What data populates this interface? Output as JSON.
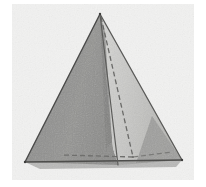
{
  "figure": {
    "title": "Tetrahedron",
    "alt_text": "Shaded tetrahedron with dashed hidden edges",
    "canvas": {
      "width": 206,
      "height": 187,
      "background_color": "#ffffff"
    },
    "backdrop": {
      "name": "scanned-paper-backdrop",
      "color": "#f2f2f1",
      "edge_color": "#ebebea",
      "x": 12,
      "y": 4,
      "width": 182,
      "height": 176
    },
    "vertices": {
      "apex": {
        "label": "apex",
        "x": 100,
        "y": 14
      },
      "front_left": {
        "label": "front-left-base",
        "x": 25,
        "y": 162
      },
      "front_right": {
        "label": "front-right-base",
        "x": 182,
        "y": 160
      },
      "back": {
        "label": "hidden-back-base",
        "x": 133,
        "y": 157
      },
      "mid_front": {
        "label": "front-base-midpoint",
        "x": 118,
        "y": 165
      }
    },
    "faces": [
      {
        "name": "left-face",
        "fill": "#8f8f8e",
        "points": "100,14 25,162 118,165 113,148"
      },
      {
        "name": "front-right-face",
        "fill": "#c9c9c7",
        "points": "100,14 113,148 118,165 182,160"
      },
      {
        "name": "right-shadow-face",
        "fill": "#9a9a98",
        "points": "152,116 182,160 138,163"
      },
      {
        "name": "apex-spine-wedge",
        "fill": "#7d7d7c",
        "points": "100,14 104,30 110,140 106,146"
      }
    ],
    "edges": [
      {
        "name": "edge-apex-to-front-left",
        "style": "solid",
        "color": "#4a4a49",
        "width": 1.4,
        "x1": 100,
        "y1": 14,
        "x2": 25,
        "y2": 162
      },
      {
        "name": "edge-apex-to-front-right",
        "style": "solid",
        "color": "#5a5a58",
        "width": 1.3,
        "x1": 100,
        "y1": 14,
        "x2": 182,
        "y2": 160
      },
      {
        "name": "edge-front-base",
        "style": "solid",
        "color": "#4e4e4c",
        "width": 1.4,
        "x1": 25,
        "y1": 162,
        "x2": 182,
        "y2": 160
      },
      {
        "name": "edge-apex-to-front-midline",
        "style": "solid",
        "color": "#5c5c5a",
        "width": 1.2,
        "x1": 100,
        "y1": 14,
        "x2": 118,
        "y2": 165
      },
      {
        "name": "hidden-edge-apex-to-back",
        "style": "dashed",
        "color": "#6a6a68",
        "width": 1.3,
        "x1": 101,
        "y1": 17,
        "x2": 133,
        "y2": 157
      },
      {
        "name": "hidden-edge-back-to-front-left",
        "style": "dashed",
        "color": "#6f6f6d",
        "width": 1.3,
        "x1": 133,
        "y1": 157,
        "x2": 62,
        "y2": 155
      },
      {
        "name": "hidden-edge-back-to-front-right",
        "style": "dashed",
        "color": "#7a7a78",
        "width": 1.2,
        "x1": 133,
        "y1": 157,
        "x2": 172,
        "y2": 152
      }
    ],
    "dash_pattern": "5 3",
    "colors": {
      "page_background": "#ffffff",
      "figure_backdrop": "#f2f2f1",
      "left_face": "#8f8f8e",
      "right_face": "#c9c9c7",
      "shadow_face": "#9a9a98",
      "outline": "#4a4a49",
      "hidden_edge": "#6a6a68"
    }
  }
}
